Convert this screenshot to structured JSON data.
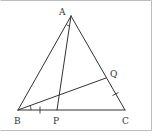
{
  "diagram": {
    "type": "geometry-triangle",
    "points": {
      "A": {
        "label": "A",
        "x": 71,
        "y": 16
      },
      "B": {
        "label": "B",
        "x": 18,
        "y": 110
      },
      "C": {
        "label": "C",
        "x": 125,
        "y": 110
      },
      "P": {
        "label": "P",
        "x": 57,
        "y": 110
      },
      "Q": {
        "label": "Q",
        "x": 106,
        "y": 78
      }
    },
    "segments": [
      "AB",
      "BC",
      "CA",
      "AP",
      "BQ"
    ],
    "marks": [
      {
        "type": "angle-arc",
        "at": "A",
        "between": [
          "AB",
          "AP"
        ]
      },
      {
        "type": "angle-arc",
        "at": "B",
        "between": [
          "BC",
          "BQ"
        ]
      },
      {
        "type": "tick",
        "on": "BP"
      },
      {
        "type": "tick",
        "on": "QC"
      }
    ],
    "labels": {
      "A": "A",
      "B": "B",
      "C": "C",
      "P": "P",
      "Q": "Q"
    }
  }
}
